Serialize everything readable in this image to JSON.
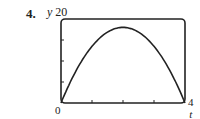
{
  "problem_number": "4.",
  "y_axis": {
    "name": "y",
    "max_label": "20"
  },
  "x_axis": {
    "name": "t",
    "max_label": "4"
  },
  "origin_label": "0",
  "chart_data": {
    "type": "line",
    "title": "",
    "xlabel": "t",
    "ylabel": "y",
    "xlim": [
      0,
      4
    ],
    "ylim": [
      0,
      20
    ],
    "x_ticks": [
      1,
      2,
      3
    ],
    "y_ticks": [
      5,
      10,
      15
    ],
    "grid": false,
    "series": [
      {
        "name": "y(t)",
        "x": [
          0,
          0.5,
          1,
          1.5,
          2,
          2.5,
          3,
          3.5,
          4
        ],
        "values": [
          0,
          7.9,
          13.5,
          16.9,
          18,
          16.9,
          13.5,
          7.9,
          0
        ]
      }
    ]
  }
}
